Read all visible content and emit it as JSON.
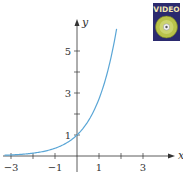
{
  "badge": {
    "label": "VIDEO",
    "bg": "#2b2a6e",
    "text_color": "#f2e7b0"
  },
  "chart_data": {
    "type": "line",
    "title": "",
    "xlabel": "x",
    "ylabel": "y",
    "function": "y = e^x",
    "xlim": [
      -3.4,
      4.1
    ],
    "ylim": [
      0,
      6.4
    ],
    "x_ticks": [
      -3,
      -2,
      -1,
      0,
      1,
      2,
      3
    ],
    "x_tick_labels": [
      "−3",
      "",
      "−1",
      "",
      "1",
      "",
      "3"
    ],
    "y_ticks": [
      1,
      2,
      3,
      4,
      5
    ],
    "y_tick_labels": [
      "1",
      "",
      "3",
      "",
      "5"
    ],
    "grid": false,
    "legend": null,
    "series": [
      {
        "name": "e^x",
        "color": "#5aa6d6",
        "x": [
          -3.3,
          -3,
          -2.5,
          -2,
          -1.5,
          -1,
          -0.5,
          0,
          0.5,
          1,
          1.25,
          1.5,
          1.65,
          1.8
        ],
        "y": [
          0.037,
          0.05,
          0.082,
          0.135,
          0.223,
          0.368,
          0.607,
          1.0,
          1.649,
          2.718,
          3.49,
          4.482,
          5.207,
          6.05
        ]
      }
    ]
  },
  "layout": {
    "origin_px": [
      77,
      156
    ],
    "unit_x_px": 22,
    "unit_y_px": 21
  }
}
